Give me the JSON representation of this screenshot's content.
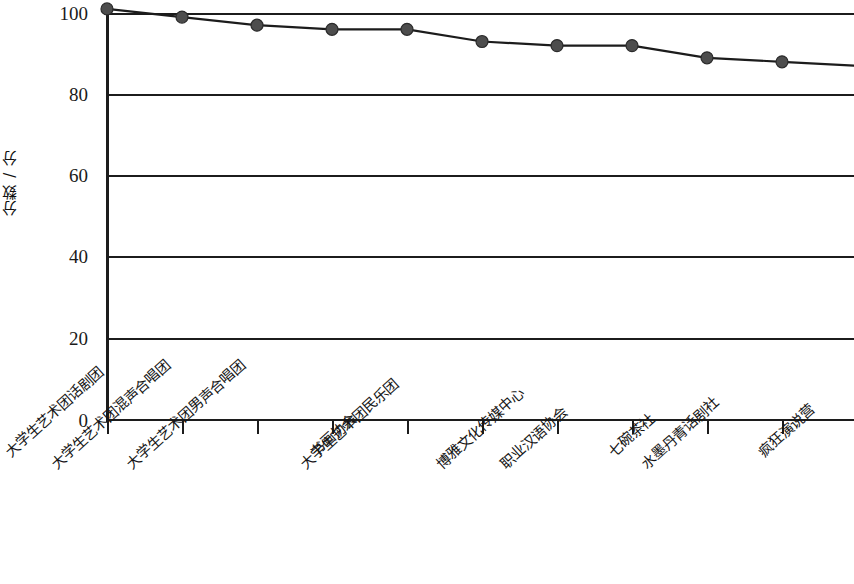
{
  "chart_data": {
    "type": "line",
    "title": "",
    "subtitle": "",
    "xlabel": "",
    "ylabel": "分数 / 分",
    "ylim": [
      0,
      100
    ],
    "yticks": [
      0,
      20,
      40,
      60,
      80,
      100
    ],
    "grid": true,
    "legend": false,
    "legend_position": "none",
    "marker": "circle",
    "marker_color": "#4d4d4d",
    "line_color": "#1c1c1c",
    "note": "Right edge of plot is cropped; an 11th category continues beyond the image border.",
    "categories": [
      "大学生艺术团话剧团",
      "大学生艺术团混声合唱团",
      "大学生艺术团男声合唱团",
      "书画协会",
      "大学生艺术团民乐团",
      "博雅文化传媒中心",
      "职业汉语协会",
      "七碗茶社",
      "水墨丹青话剧社",
      "疯狂演说营"
    ],
    "values": [
      101,
      99,
      97,
      96,
      96,
      93,
      92,
      92,
      89,
      88
    ],
    "series": [
      {
        "name": "分数",
        "values": [
          101,
          99,
          97,
          96,
          96,
          93,
          92,
          92,
          89,
          88
        ]
      }
    ]
  },
  "axes": {
    "y_title": "分数 / 分",
    "y_tick_labels": [
      "100",
      "80",
      "60",
      "40",
      "20",
      "0"
    ]
  }
}
